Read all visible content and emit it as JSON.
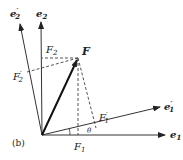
{
  "figure_label": "(b)",
  "axes": {
    "e1": {
      "base": "e",
      "sub": "1",
      "prime": ""
    },
    "e2": {
      "base": "e",
      "sub": "2",
      "prime": ""
    },
    "e1p": {
      "base": "e",
      "sub": "1",
      "prime": "′"
    },
    "e2p": {
      "base": "e",
      "sub": "2",
      "prime": "′"
    }
  },
  "vector": {
    "label": "F"
  },
  "components": {
    "F1": {
      "base": "F",
      "sub": "1",
      "prime": ""
    },
    "F2": {
      "base": "F",
      "sub": "2",
      "prime": ""
    },
    "F1p": {
      "base": "F",
      "sub": "1",
      "prime": "′"
    },
    "F2p": {
      "base": "F",
      "sub": "2",
      "prime": "′"
    }
  },
  "angle": {
    "label": "θ"
  },
  "colors": {
    "line": "#333333",
    "vector": "#111111",
    "dash": "#555555"
  }
}
